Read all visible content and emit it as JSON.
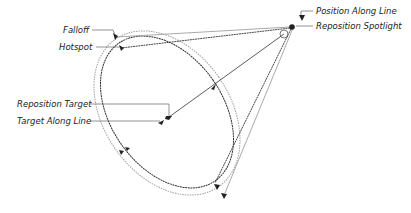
{
  "diagram": {
    "labels": {
      "falloff": "Falloff",
      "hotspot": "Hotspot",
      "reposition_target": "Reposition Target",
      "target_along_line": "Target Along Line",
      "position_along_line": "Position Along Line",
      "reposition_spotlight": "Reposition Spotlight"
    },
    "colors": {
      "hotspot_line": "#333333",
      "falloff_line": "#9a9a9a",
      "leader_line": "#666666",
      "label_text": "#222222"
    }
  }
}
